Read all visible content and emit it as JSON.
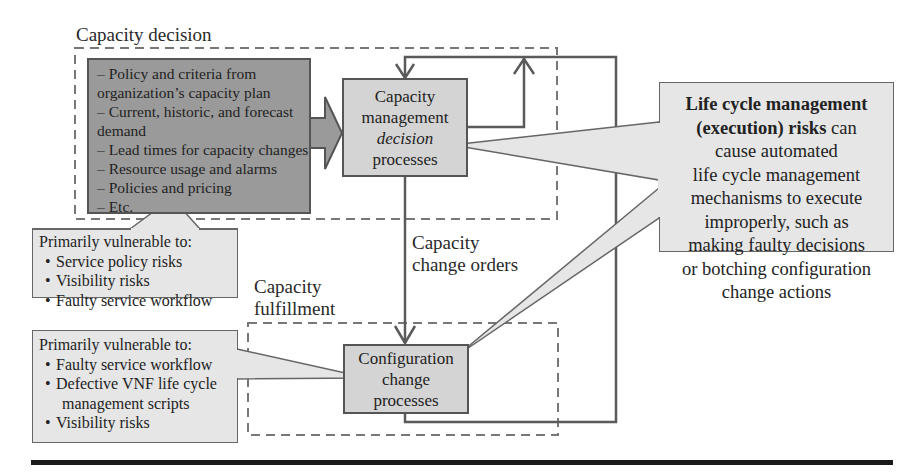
{
  "colors": {
    "dark_box_fill": "#9a9a9a",
    "process_fill": "#d4d4d4",
    "callout_fill": "#e6e6e6",
    "line": "#555555",
    "dashed": "#777777",
    "rule": "#1a1a1a"
  },
  "regions": {
    "decision_label": "Capacity decision",
    "fulfillment_label_line1": "Capacity",
    "fulfillment_label_line2": "fulfillment"
  },
  "inputs_box": {
    "lines": [
      "– Policy and criteria from",
      "organization’s capacity plan",
      "– Current, historic, and forecast",
      "demand",
      "– Lead times for capacity changes",
      "– Resource usage and alarms",
      "– Policies and pricing",
      "– Etc."
    ]
  },
  "decision_process": {
    "line1": "Capacity",
    "line2": "management",
    "line3_italic": "decision",
    "line4": "processes"
  },
  "config_process": {
    "line1": "Configuration",
    "line2": "change",
    "line3": "processes"
  },
  "orders_label": {
    "line1": "Capacity",
    "line2": "change orders"
  },
  "callout_decision": {
    "heading": "Primarily vulnerable to:",
    "bullet": "•",
    "items": [
      "Service policy risks",
      "Visibility risks",
      "Faulty service workflow"
    ]
  },
  "callout_fulfillment": {
    "heading": "Primarily vulnerable to:",
    "bullet": "•",
    "items": [
      "Faulty service workflow",
      "Defective VNF life cycle",
      "Visibility risks"
    ],
    "item2_continuation": "management scripts"
  },
  "lcm_callout": {
    "bold_line1": "Life cycle management",
    "bold_line2": "(execution) risks",
    "line2_rest": " can",
    "lines": [
      "cause automated",
      "life cycle management",
      "mechanisms to execute",
      "improperly, such as",
      "making faulty decisions",
      "or botching configuration",
      "change actions"
    ]
  }
}
